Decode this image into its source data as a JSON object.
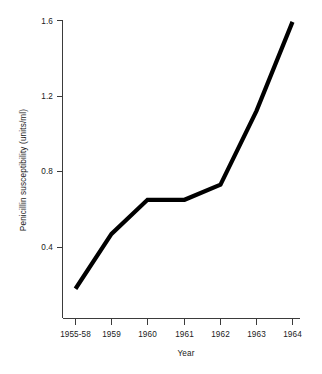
{
  "chart_data": {
    "type": "line",
    "title": "",
    "subtitle": "",
    "xlabel": "Year",
    "ylabel": "Penicillin susceptibility (units/ml)",
    "categories": [
      "1955-58",
      "1959",
      "1960",
      "1961",
      "1962",
      "1963",
      "1964"
    ],
    "values": [
      0.18,
      0.47,
      0.65,
      0.65,
      0.73,
      1.12,
      1.59
    ],
    "series": [
      {
        "name": "Penicillin susceptibility",
        "values": [
          0.18,
          0.47,
          0.65,
          0.65,
          0.73,
          1.12,
          1.59
        ]
      }
    ],
    "ytick_labels": [
      "0.4",
      "0.8",
      "1.2",
      "1.6"
    ],
    "ytick_values": [
      0.4,
      0.8,
      1.2,
      1.6
    ],
    "ylim": [
      0.0,
      1.6
    ],
    "xlim": [
      0,
      6
    ],
    "grid": false,
    "legend": false,
    "legend_position": "none",
    "line_color": "#000000",
    "axis_color": "#3b3b3b",
    "background_color": "#ffffff",
    "annotations": []
  },
  "figure": {
    "axis_x_label": "Year",
    "axis_y_label": "Penicillin susceptibility (units/ml)"
  }
}
